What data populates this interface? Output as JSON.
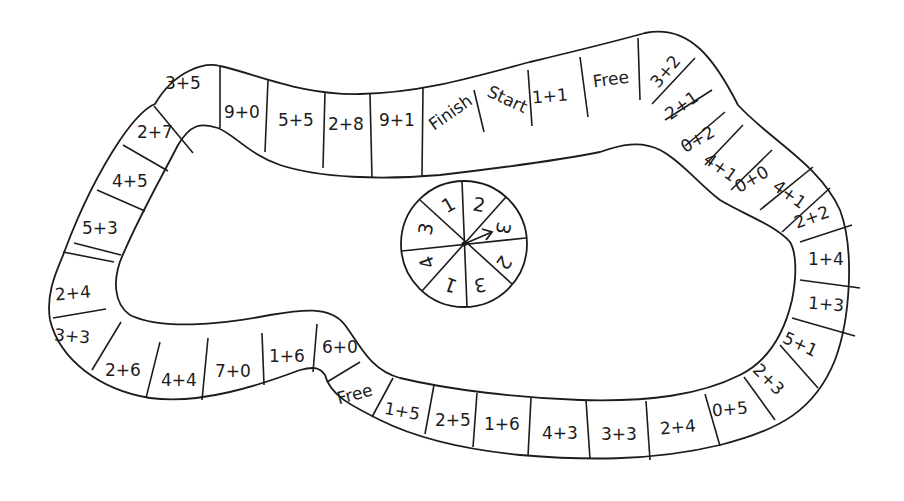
{
  "board": {
    "type": "addition-facts board game",
    "start_label": "Start",
    "finish_label": "Finish",
    "squares": [
      {
        "label": "Start",
        "x": 507,
        "y": 100,
        "rot": 25
      },
      {
        "label": "1+1",
        "x": 550,
        "y": 97,
        "rot": -5
      },
      {
        "label": "Free",
        "x": 611,
        "y": 80,
        "rot": -8
      },
      {
        "label": "3+2",
        "x": 658,
        "y": 80,
        "rot": -50
      },
      {
        "label": "2+1",
        "x": 677,
        "y": 111,
        "rot": -35
      },
      {
        "label": "0+2",
        "x": 697,
        "y": 140,
        "rot": -30
      },
      {
        "label": "4+1",
        "x": 721,
        "y": 169,
        "rot": 35
      },
      {
        "label": "0+0",
        "x": 756,
        "y": 179,
        "rot": -30
      },
      {
        "label": "4+1",
        "x": 789,
        "y": 195,
        "rot": 35
      },
      {
        "label": "2+2",
        "x": 813,
        "y": 218,
        "rot": -20
      },
      {
        "label": "1+4",
        "x": 825,
        "y": 256,
        "rot": 0
      },
      {
        "label": "1+3",
        "x": 826,
        "y": 306,
        "rot": 5
      },
      {
        "label": "5+1",
        "x": 795,
        "y": 345,
        "rot": 25
      },
      {
        "label": "2+3",
        "x": 760,
        "y": 382,
        "rot": 45
      },
      {
        "label": "0+5",
        "x": 727,
        "y": 410,
        "rot": -5
      },
      {
        "label": "2+4",
        "x": 676,
        "y": 423,
        "rot": -5
      },
      {
        "label": "3+3",
        "x": 620,
        "y": 437,
        "rot": 0
      },
      {
        "label": "4+3",
        "x": 560,
        "y": 435,
        "rot": 0
      },
      {
        "label": "1+6",
        "x": 501,
        "y": 425,
        "rot": 0
      },
      {
        "label": "2+5",
        "x": 449,
        "y": 422,
        "rot": 0
      },
      {
        "label": "1+5",
        "x": 400,
        "y": 413,
        "rot": 10
      },
      {
        "label": "Free",
        "x": 355,
        "y": 395,
        "rot": -15
      },
      {
        "label": "6+0",
        "x": 340,
        "y": 348,
        "rot": 0
      },
      {
        "label": "1+6",
        "x": 287,
        "y": 358,
        "rot": 0
      },
      {
        "label": "7+0",
        "x": 232,
        "y": 372,
        "rot": 0
      },
      {
        "label": "4+4",
        "x": 180,
        "y": 381,
        "rot": 0
      },
      {
        "label": "2+6",
        "x": 121,
        "y": 372,
        "rot": 0
      },
      {
        "label": "3+3",
        "x": 71,
        "y": 337,
        "rot": 5
      },
      {
        "label": "2+4",
        "x": 72,
        "y": 293,
        "rot": -5
      },
      {
        "label": "5+3",
        "x": 100,
        "y": 229,
        "rot": 0
      },
      {
        "label": "4+5",
        "x": 130,
        "y": 181,
        "rot": 0
      },
      {
        "label": "2+7",
        "x": 155,
        "y": 131,
        "rot": 0
      },
      {
        "label": "3+5",
        "x": 183,
        "y": 83,
        "rot": 0
      },
      {
        "label": "9+0",
        "x": 242,
        "y": 112,
        "rot": 0
      },
      {
        "label": "5+5",
        "x": 296,
        "y": 120,
        "rot": 0
      },
      {
        "label": "2+8",
        "x": 345,
        "y": 125,
        "rot": 0
      },
      {
        "label": "9+1",
        "x": 397,
        "y": 121,
        "rot": 0
      },
      {
        "label": "Finish",
        "x": 451,
        "y": 111,
        "rot": -35
      }
    ]
  },
  "spinner": {
    "center_x": 464,
    "center_y": 244,
    "radius": 63,
    "segments": [
      {
        "value": "2",
        "x": 479,
        "y": 206,
        "rot": 10
      },
      {
        "value": "3",
        "x": 500,
        "y": 229,
        "rot": 100
      },
      {
        "value": "2",
        "x": 503,
        "y": 262,
        "rot": 125
      },
      {
        "value": "3",
        "x": 480,
        "y": 284,
        "rot": 170
      },
      {
        "value": "1",
        "x": 452,
        "y": 284,
        "rot": 200
      },
      {
        "value": "4",
        "x": 430,
        "y": 262,
        "rot": 250
      },
      {
        "value": "3",
        "x": 427,
        "y": 229,
        "rot": 280
      },
      {
        "value": "1",
        "x": 449,
        "y": 206,
        "rot": -30
      }
    ],
    "arrow_label": "spinner-arrow"
  }
}
